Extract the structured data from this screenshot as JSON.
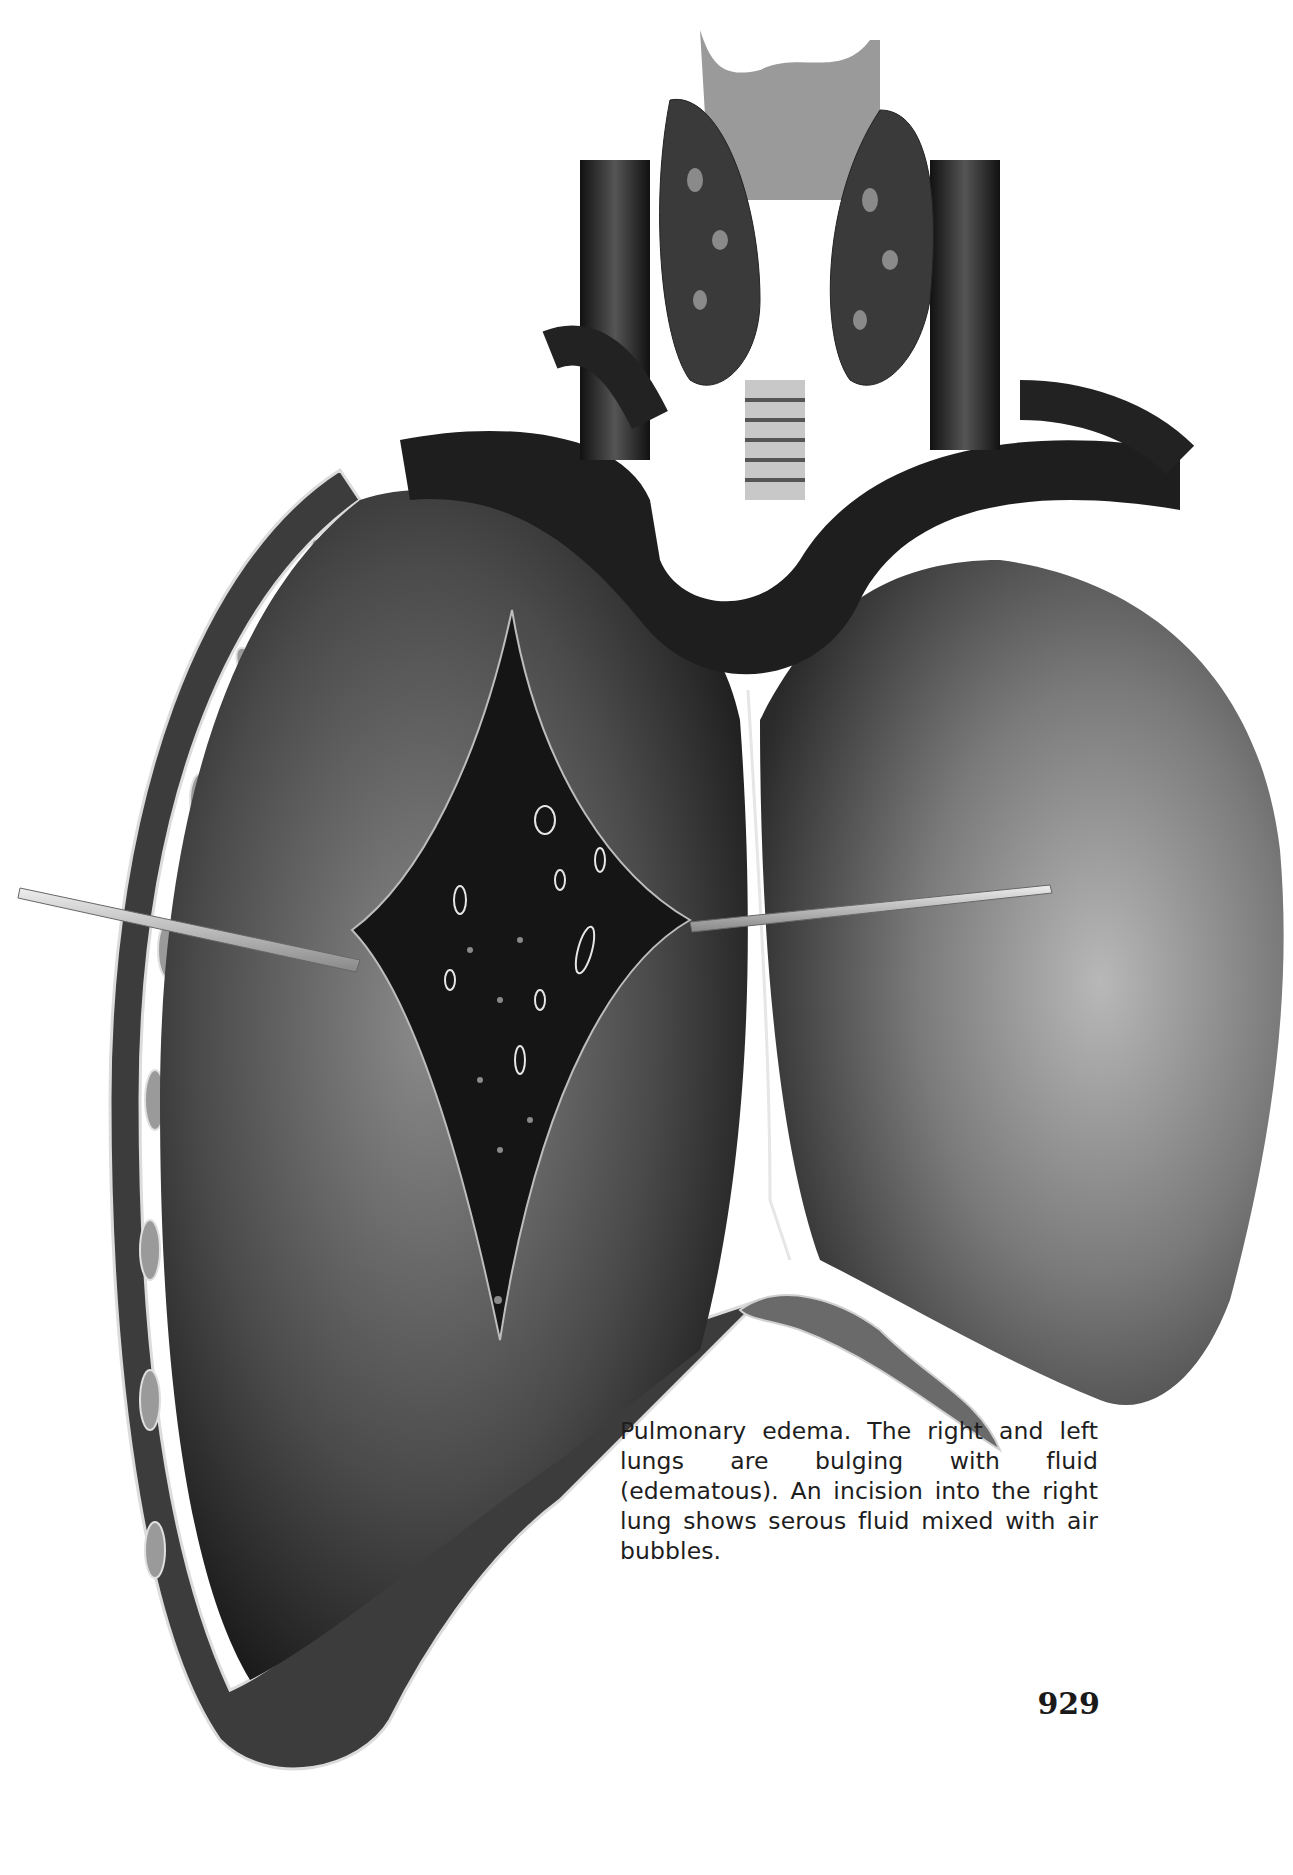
{
  "figure": {
    "palette": {
      "background": "#ffffff",
      "tissue_dark": "#1a1a1a",
      "tissue_mid": "#5a5a5a",
      "tissue_light": "#a8a8a8",
      "highlight": "#e8e8e8"
    }
  },
  "caption": {
    "text": "Pulmonary edema. The right and left lungs are bulging with fluid (edematous). An incision into the right lung shows serous fluid mixed with air bubbles."
  },
  "page": {
    "number": "929"
  }
}
